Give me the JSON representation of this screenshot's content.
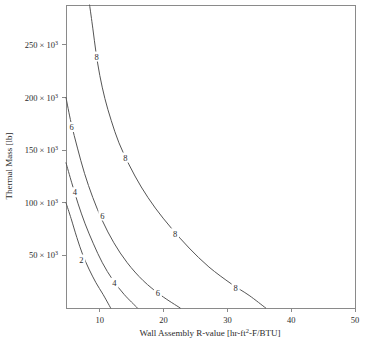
{
  "chart_data": {
    "type": "line",
    "subtype": "contour",
    "title": "",
    "xlabel": "Wall Assembly R-value [hr-ft²-F/BTU]",
    "ylabel": "Thermal Mass [lb]",
    "xlim": [
      4.7,
      50
    ],
    "ylim": [
      0,
      288000
    ],
    "grid": false,
    "legend": "none",
    "xticks": [
      10,
      20,
      30,
      40,
      50
    ],
    "xtick_labels": [
      "10",
      "20",
      "30",
      "40",
      "50"
    ],
    "yticks": [
      50000,
      100000,
      150000,
      200000,
      250000
    ],
    "ytick_labels": [
      "50 × 10³",
      "100 × 10³",
      "150 × 10³",
      "200 × 10³",
      "250 × 10³"
    ],
    "ytick_label_parts": [
      {
        "mantissa": "50 × 10",
        "exponent": "3"
      },
      {
        "mantissa": "100 × 10",
        "exponent": "3"
      },
      {
        "mantissa": "150 × 10",
        "exponent": "3"
      },
      {
        "mantissa": "200 × 10",
        "exponent": "3"
      },
      {
        "mantissa": "250 × 10",
        "exponent": "3"
      }
    ],
    "xlabel_parts": {
      "before": "Wall Assembly R-value [hr-ft",
      "exponent": "2",
      "after": "-F/BTU]"
    },
    "contour_levels": [
      2,
      4,
      6,
      8
    ],
    "contours": [
      {
        "level": 2,
        "label": "2",
        "points": [
          [
            4.7,
            100000
          ],
          [
            5.5,
            85000
          ],
          [
            6.4,
            67000
          ],
          [
            7.3,
            51000
          ],
          [
            8.3,
            37000
          ],
          [
            9.4,
            24000
          ],
          [
            10.5,
            13000
          ],
          [
            11.7,
            0
          ]
        ],
        "label_positions": [
          [
            7.1,
            46000
          ]
        ]
      },
      {
        "level": 4,
        "label": "4",
        "points": [
          [
            4.7,
            138000
          ],
          [
            5.6,
            119000
          ],
          [
            6.6,
            99000
          ],
          [
            7.7,
            80000
          ],
          [
            9.0,
            61000
          ],
          [
            10.4,
            43000
          ],
          [
            12.0,
            27000
          ],
          [
            13.8,
            13000
          ],
          [
            15.9,
            0
          ]
        ],
        "label_positions": [
          [
            6.1,
            110000
          ],
          [
            12.3,
            24000
          ]
        ]
      },
      {
        "level": 6,
        "label": "6",
        "points": [
          [
            4.7,
            200000
          ],
          [
            5.5,
            176000
          ],
          [
            6.5,
            152000
          ],
          [
            7.6,
            128000
          ],
          [
            8.9,
            105000
          ],
          [
            10.4,
            83000
          ],
          [
            12.2,
            62000
          ],
          [
            14.3,
            43000
          ],
          [
            16.8,
            26000
          ],
          [
            19.6,
            12000
          ],
          [
            22.6,
            0
          ]
        ],
        "label_positions": [
          [
            5.6,
            172000
          ],
          [
            10.4,
            88000
          ],
          [
            19.1,
            14000
          ]
        ]
      },
      {
        "level": 8,
        "label": "8",
        "points": [
          [
            8.4,
            288000
          ],
          [
            8.9,
            266000
          ],
          [
            9.4,
            243000
          ],
          [
            10.0,
            221000
          ],
          [
            10.8,
            199000
          ],
          [
            11.8,
            178000
          ],
          [
            13.0,
            157000
          ],
          [
            14.6,
            136000
          ],
          [
            16.5,
            115000
          ],
          [
            18.7,
            95000
          ],
          [
            21.2,
            76000
          ],
          [
            24.0,
            57000
          ],
          [
            27.1,
            39000
          ],
          [
            30.6,
            23000
          ],
          [
            33.4,
            12000
          ],
          [
            36.0,
            0
          ]
        ],
        "label_positions": [
          [
            9.5,
            239000
          ],
          [
            14.0,
            143000
          ],
          [
            21.8,
            71000
          ],
          [
            31.3,
            19000
          ]
        ]
      }
    ]
  },
  "colors": {
    "axis": "#8a8a8a",
    "contour": "#555555",
    "text": "#2b2b2b",
    "background": "#ffffff"
  }
}
